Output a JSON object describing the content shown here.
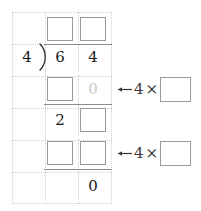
{
  "worksheet": {
    "type": "long-division",
    "problem": "64 ÷ 4",
    "divisor": "4",
    "dividend_digits": [
      "6",
      "4"
    ],
    "bracket_glyph": ")",
    "grid": {
      "columns": 3,
      "rows": 6,
      "style": "dotted"
    }
  },
  "quotient_row": {
    "label": "quotient",
    "boxes": [
      {
        "name": "quotient-tens-box",
        "value": ""
      },
      {
        "name": "quotient-ones-box",
        "value": ""
      }
    ]
  },
  "dividend_row": {
    "divisor": "4",
    "bracket": ")",
    "digits": [
      "6",
      "4"
    ]
  },
  "subtract_row_1": {
    "box": {
      "name": "partial-product-tens-box",
      "value": ""
    },
    "digit": "0",
    "digit_muted": true
  },
  "remainder_row": {
    "digit": "2",
    "box": {
      "name": "bring-down-box",
      "value": ""
    }
  },
  "subtract_row_2": {
    "boxes": [
      {
        "name": "partial-product2-tens-box",
        "value": ""
      },
      {
        "name": "partial-product2-ones-box",
        "value": ""
      }
    ]
  },
  "final_row": {
    "digit": "0"
  },
  "hints": [
    {
      "name": "hint-multiply-1",
      "arrow": "left-arrow-icon",
      "multiplier": "4",
      "times_symbol": "×",
      "box": {
        "name": "hint-factor-1-box",
        "value": ""
      }
    },
    {
      "name": "hint-multiply-2",
      "arrow": "left-arrow-icon",
      "multiplier": "4",
      "times_symbol": "×",
      "box": {
        "name": "hint-factor-2-box",
        "value": ""
      }
    }
  ],
  "colors": {
    "grid_dot": "#cfcfcf",
    "box_border": "#9a9a9a",
    "rule": "#8e8e8e",
    "digit": "#1a1a1a",
    "digit_muted": "#c9c9c9"
  }
}
